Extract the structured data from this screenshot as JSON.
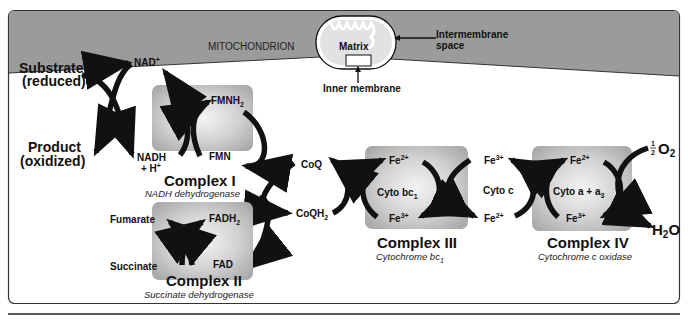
{
  "header": {
    "region_label": "MITOCHONDRION",
    "matrix_label": "Matrix",
    "intermembrane_label_1": "Intermembrane",
    "intermembrane_label_2": "space",
    "inner_membrane_label": "Inner membrane"
  },
  "substrate": {
    "substrate_1": "Substrate",
    "substrate_2": "(reduced)",
    "product_1": "Product",
    "product_2": "(oxidized)"
  },
  "complex1": {
    "title": "Complex I",
    "subtitle": "NADH dehydrogenase",
    "nad": "NAD",
    "nad_sup": "+",
    "nadh": "NADH",
    "nadh_h": "+ H",
    "nadh_h_sup": "+",
    "fmnh": "FMNH",
    "fmnh_sub": "2",
    "fmn": "FMN"
  },
  "complex2": {
    "title": "Complex II",
    "subtitle": "Succinate dehydrogenase",
    "fumarate": "Fumarate",
    "succinate": "Succinate",
    "fadh": "FADH",
    "fadh_sub": "2",
    "fad": "FAD"
  },
  "coq": {
    "coq": "CoQ",
    "coqh": "CoQH",
    "coqh_sub": "2"
  },
  "complex3": {
    "title": "Complex III",
    "subtitle": "Cytochrome bc",
    "subtitle_sub": "1",
    "center": "Cyto bc",
    "center_sub": "1",
    "fe2": "Fe",
    "fe2_sup": "2+",
    "fe3": "Fe",
    "fe3_sup": "3+"
  },
  "cytoc": {
    "center": "Cyto c",
    "fe3": "Fe",
    "fe3_sup": "3+",
    "fe2": "Fe",
    "fe2_sup": "2+"
  },
  "complex4": {
    "title": "Complex IV",
    "subtitle": "Cytochrome c oxidase",
    "center": "Cyto a + a",
    "center_sub": "3",
    "fe2": "Fe",
    "fe2_sup": "2+",
    "fe3": "Fe",
    "fe3_sup": "3+",
    "o2_num": "1",
    "o2_den": "2",
    "o2": "O",
    "o2_sub": "2",
    "h2o_h": "H",
    "h2o_sub": "2",
    "h2o_o": "O"
  },
  "colors": {
    "header_band": "#9a9a9a",
    "complex_box": "#bdbdbd",
    "arrow": "#111111"
  }
}
